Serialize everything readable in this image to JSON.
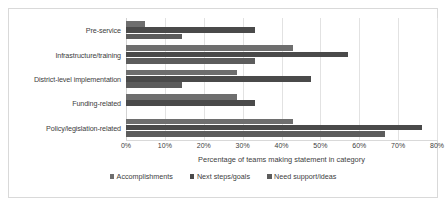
{
  "chart_data": {
    "type": "bar",
    "orientation": "horizontal",
    "title": "",
    "xlabel": "Percentage of teams making statement in category",
    "ylabel": "",
    "xlim": [
      0,
      80
    ],
    "xtick_labels": [
      "0%",
      "10%",
      "20%",
      "30%",
      "40%",
      "50%",
      "60%",
      "70%",
      "80%"
    ],
    "xticks": [
      0,
      10,
      20,
      30,
      40,
      50,
      60,
      70,
      80
    ],
    "grid": true,
    "legend_position": "bottom",
    "categories": [
      "Pre-service",
      "Infrastructure/training",
      "District-level implementation",
      "Funding-related",
      "Policy/legislation-related"
    ],
    "series": [
      {
        "name": "Accomplishments",
        "color": "#6e6e6e",
        "values": [
          4.8,
          42.9,
          28.6,
          28.6,
          42.9
        ]
      },
      {
        "name": "Next steps/goals",
        "color": "#4a4a4a",
        "values": [
          33.3,
          57.1,
          47.6,
          33.3,
          76.2
        ]
      },
      {
        "name": "Need support/ideas",
        "color": "#5c5c5c",
        "values": [
          14.3,
          33.3,
          14.3,
          0,
          66.7
        ]
      }
    ]
  },
  "colors": {
    "frame_border": "#d9d9d9",
    "gridline": "#e2e2e2",
    "text": "#404040",
    "background": "#ffffff"
  }
}
